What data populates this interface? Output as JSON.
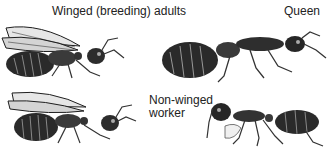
{
  "labels": {
    "winged": "Winged (breeding) adults",
    "queen": "Queen",
    "worker_line1": "Non-winged",
    "worker_line2": "worker"
  },
  "figures": [
    {
      "name": "winged-adult-top",
      "caste": "Winged (breeding) adult"
    },
    {
      "name": "winged-adult-bottom",
      "caste": "Winged (breeding) adult"
    },
    {
      "name": "queen",
      "caste": "Queen"
    },
    {
      "name": "worker",
      "caste": "Non-winged worker"
    }
  ],
  "colors": {
    "ink": "#1e1e1e",
    "wing": "#d8d8d8",
    "background": "#ffffff"
  }
}
